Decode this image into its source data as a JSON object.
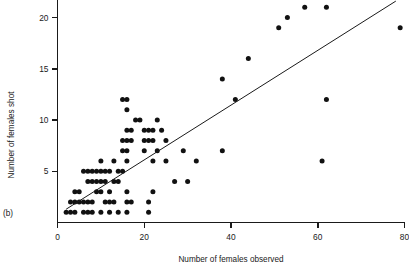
{
  "figure": {
    "panel_label": "(b)",
    "background": "#ffffff",
    "point_color": "#111111",
    "axis_color": "#1a1a1a"
  },
  "chart_data": {
    "type": "scatter",
    "title": "",
    "xlabel": "Number of females observed",
    "ylabel": "Number of females shot",
    "xlim": [
      0,
      80
    ],
    "ylim": [
      0,
      22
    ],
    "xticks": [
      0,
      20,
      40,
      60,
      80
    ],
    "xticklabels": [
      "0",
      "20",
      "40",
      "60",
      "80"
    ],
    "yticks": [
      5,
      10,
      15,
      20
    ],
    "yticklabels": [
      "5",
      "10",
      "15",
      "20"
    ],
    "grid": false,
    "legend": null,
    "trendline": {
      "type": "linear-fit",
      "x_start": 2.0,
      "y_start": 1.3,
      "x_end": 78.0,
      "y_end": 21.6
    },
    "series": [
      {
        "name": "females shot vs observed",
        "marker": "filled-circle",
        "points": [
          [
            2,
            1
          ],
          [
            3,
            1
          ],
          [
            4,
            1
          ],
          [
            6,
            1
          ],
          [
            7,
            1
          ],
          [
            8,
            1
          ],
          [
            10,
            1
          ],
          [
            12,
            1
          ],
          [
            14,
            1
          ],
          [
            16,
            1
          ],
          [
            21,
            1
          ],
          [
            3,
            2
          ],
          [
            4,
            2
          ],
          [
            5,
            2
          ],
          [
            6,
            2
          ],
          [
            7,
            2
          ],
          [
            8,
            2
          ],
          [
            11,
            2
          ],
          [
            12,
            2
          ],
          [
            13,
            2
          ],
          [
            16,
            2
          ],
          [
            17,
            2
          ],
          [
            21,
            2
          ],
          [
            4,
            3
          ],
          [
            5,
            3
          ],
          [
            9,
            3
          ],
          [
            10,
            3
          ],
          [
            12,
            3
          ],
          [
            16,
            3
          ],
          [
            22,
            3
          ],
          [
            7,
            4
          ],
          [
            8,
            4
          ],
          [
            9,
            4
          ],
          [
            10,
            4
          ],
          [
            11,
            4
          ],
          [
            13,
            4
          ],
          [
            14,
            4
          ],
          [
            27,
            4
          ],
          [
            30,
            4
          ],
          [
            6,
            5
          ],
          [
            7,
            5
          ],
          [
            8,
            5
          ],
          [
            9,
            5
          ],
          [
            10,
            5
          ],
          [
            11,
            5
          ],
          [
            12,
            5
          ],
          [
            14,
            5
          ],
          [
            15,
            5
          ],
          [
            10,
            6
          ],
          [
            13,
            6
          ],
          [
            16,
            6
          ],
          [
            22,
            6
          ],
          [
            25,
            6
          ],
          [
            32,
            6
          ],
          [
            61,
            6
          ],
          [
            15,
            7
          ],
          [
            16,
            7
          ],
          [
            20,
            7
          ],
          [
            23,
            7
          ],
          [
            29,
            7
          ],
          [
            38,
            7
          ],
          [
            15,
            8
          ],
          [
            16,
            8
          ],
          [
            17,
            8
          ],
          [
            20,
            8
          ],
          [
            21,
            8
          ],
          [
            22,
            8
          ],
          [
            25,
            8
          ],
          [
            16,
            9
          ],
          [
            17,
            9
          ],
          [
            20,
            9
          ],
          [
            21,
            9
          ],
          [
            22,
            9
          ],
          [
            24,
            9
          ],
          [
            18,
            10
          ],
          [
            19,
            10
          ],
          [
            23,
            10
          ],
          [
            15,
            12
          ],
          [
            16,
            12
          ],
          [
            16,
            11
          ],
          [
            41,
            12
          ],
          [
            62,
            12
          ],
          [
            38,
            14
          ],
          [
            44,
            16
          ],
          [
            51,
            19
          ],
          [
            53,
            20
          ],
          [
            57,
            21
          ],
          [
            62,
            21
          ],
          [
            79,
            19
          ]
        ]
      }
    ]
  }
}
